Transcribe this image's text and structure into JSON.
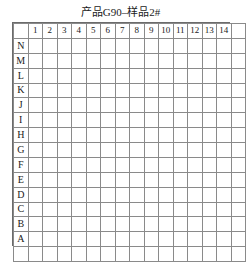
{
  "chart_data": {
    "type": "heatmap",
    "title": "产品G90–样品2#",
    "xlabel": "",
    "ylabel": "",
    "grid": true,
    "legend": null,
    "columns": [
      "1",
      "2",
      "3",
      "4",
      "5",
      "6",
      "7",
      "8",
      "9",
      "10",
      "11",
      "12",
      "13",
      "14"
    ],
    "rows": [
      "N",
      "M",
      "L",
      "K",
      "J",
      "I",
      "H",
      "G",
      "F",
      "E",
      "D",
      "C",
      "B",
      "A"
    ],
    "colors": {
      "dark": "#6e6e6e",
      "light": "#969696",
      "empty": "#ffffff",
      "gridline": "#8a8a8a",
      "border": "#6b6b6b"
    },
    "value_levels": {
      "0": "empty",
      "1": "light",
      "2": "dark"
    },
    "values": [
      [
        0,
        2,
        2,
        0,
        1,
        0,
        0,
        0,
        0,
        0,
        0,
        0,
        0,
        0
      ],
      [
        0,
        0,
        0,
        0,
        0,
        0,
        0,
        0,
        0,
        0,
        0,
        0,
        0,
        0
      ],
      [
        0,
        0,
        2,
        1,
        1,
        0,
        0,
        0,
        0,
        0,
        0,
        1,
        0,
        0
      ],
      [
        2,
        0,
        2,
        0,
        0,
        0,
        0,
        0,
        0,
        0,
        0,
        0,
        2,
        0
      ],
      [
        2,
        1,
        0,
        0,
        0,
        0,
        0,
        0,
        0,
        0,
        0,
        0,
        0,
        0
      ],
      [
        2,
        0,
        0,
        0,
        0,
        2,
        2,
        2,
        2,
        0,
        0,
        0,
        0,
        1
      ],
      [
        0,
        0,
        0,
        0,
        0,
        2,
        2,
        2,
        2,
        0,
        0,
        0,
        0,
        2
      ],
      [
        0,
        0,
        0,
        0,
        0,
        2,
        2,
        2,
        2,
        0,
        0,
        0,
        0,
        0
      ],
      [
        0,
        0,
        0,
        0,
        0,
        2,
        2,
        2,
        0,
        0,
        0,
        0,
        0,
        2
      ],
      [
        0,
        0,
        0,
        0,
        0,
        0,
        0,
        0,
        0,
        0,
        0,
        0,
        0,
        0
      ],
      [
        0,
        0,
        0,
        0,
        0,
        0,
        0,
        0,
        0,
        0,
        0,
        0,
        0,
        1
      ],
      [
        2,
        0,
        0,
        0,
        0,
        0,
        0,
        0,
        0,
        0,
        0,
        0,
        0,
        0
      ],
      [
        0,
        0,
        0,
        0,
        0,
        0,
        0,
        0,
        0,
        0,
        0,
        0,
        2,
        0
      ],
      [
        2,
        0,
        0,
        0,
        0,
        2,
        2,
        2,
        2,
        0,
        0,
        0,
        0,
        1
      ]
    ]
  }
}
